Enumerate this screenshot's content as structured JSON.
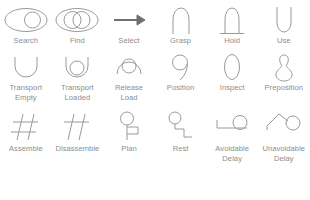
{
  "meta": {
    "stroke_color": "#9a9a9a",
    "label_color": "#8d8d8d",
    "background_color": "#ffffff"
  },
  "rows": [
    {
      "index": 1,
      "items": [
        {
          "label": "Search",
          "icon": "search-eye-ellipse-icon"
        },
        {
          "label": "Find",
          "icon": "find-two-circles-ellipse-icon"
        },
        {
          "label": "Select",
          "icon": "select-arrow-icon"
        },
        {
          "label": "Grasp",
          "icon": "grasp-arch-icon"
        },
        {
          "label": "Hold",
          "icon": "hold-arch-baseline-icon"
        },
        {
          "label": "Use",
          "icon": "use-u-icon"
        }
      ]
    },
    {
      "index": 2,
      "items": [
        {
          "label": "Transport\nEmpty",
          "icon": "transport-empty-bowl-icon"
        },
        {
          "label": "Transport\nLoaded",
          "icon": "transport-loaded-bowl-circle-icon"
        },
        {
          "label": "Release\nLoad",
          "icon": "release-load-dome-circle-icon"
        },
        {
          "label": "Position",
          "icon": "position-nine-icon"
        },
        {
          "label": "Inspect",
          "icon": "inspect-lens-icon"
        },
        {
          "label": "Preposition",
          "icon": "preposition-pin-icon"
        }
      ]
    },
    {
      "index": 3,
      "items": [
        {
          "label": "Assemble",
          "icon": "assemble-hash-icon"
        },
        {
          "label": "Disassemble",
          "icon": "disassemble-double-slash-icon"
        },
        {
          "label": "Plan",
          "icon": "plan-head-hand-icon"
        },
        {
          "label": "Rest",
          "icon": "rest-head-seat-icon"
        },
        {
          "label": "Avoidable\nDelay",
          "icon": "avoidable-delay-icon"
        },
        {
          "label": "Unavoidable\nDelay",
          "icon": "unavoidable-delay-icon"
        }
      ]
    }
  ]
}
